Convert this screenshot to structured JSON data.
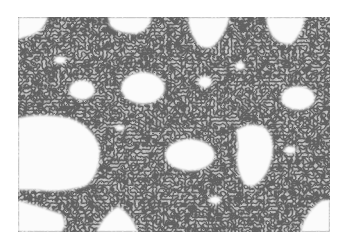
{
  "image": {
    "subject": "grayscale histology micrograph of tissue section with dense cellular nuclei and white airspaces",
    "alt": "Histology micrograph (grayscale)",
    "colors": {
      "background": "#ffffff",
      "tissue": "#8a8a8a",
      "tissue_light": "#b4b4b4",
      "nuclei": "#2a2a2a",
      "airspace": "#fbfbfb"
    }
  }
}
